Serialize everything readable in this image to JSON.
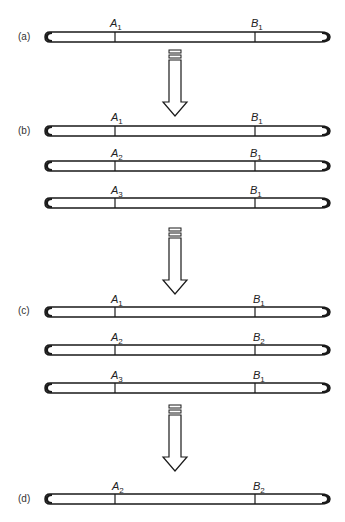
{
  "diagram": {
    "panels": [
      {
        "label": "(a)",
        "chromosomes": [
          {
            "a": "A",
            "a_sub": "1",
            "b": "B",
            "b_sub": "1"
          }
        ]
      },
      {
        "label": "(b)",
        "chromosomes": [
          {
            "a": "A",
            "a_sub": "1",
            "b": "B",
            "b_sub": "1"
          },
          {
            "a": "A",
            "a_sub": "2",
            "b": "B",
            "b_sub": "1"
          },
          {
            "a": "A",
            "a_sub": "3",
            "b": "B",
            "b_sub": "1"
          }
        ]
      },
      {
        "label": "(c)",
        "chromosomes": [
          {
            "a": "A",
            "a_sub": "1",
            "b": "B",
            "b_sub": "1"
          },
          {
            "a": "A",
            "a_sub": "2",
            "b": "B",
            "b_sub": "2"
          },
          {
            "a": "A",
            "a_sub": "3",
            "b": "B",
            "b_sub": "1"
          }
        ]
      },
      {
        "label": "(d)",
        "chromosomes": [
          {
            "a": "A",
            "a_sub": "2",
            "b": "B",
            "b_sub": "2"
          }
        ]
      }
    ],
    "arrows": 3,
    "colors": {
      "line": "#1a1a1a",
      "fill": "#ffffff"
    }
  }
}
